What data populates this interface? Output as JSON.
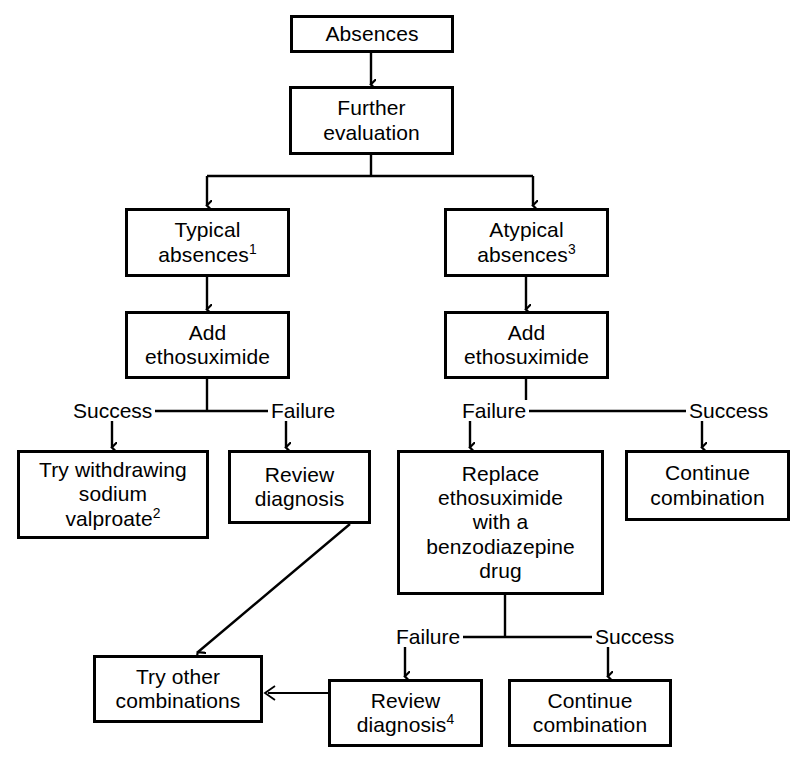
{
  "diagram": {
    "type": "flowchart",
    "colors": {
      "line": "#000000",
      "box_fill": "#ffffff",
      "text": "#000000",
      "background": "#ffffff"
    },
    "nodes": [
      {
        "id": "absences",
        "label": "Absences",
        "sup": ""
      },
      {
        "id": "further-evaluation",
        "line1": "Further",
        "line2": "evaluation"
      },
      {
        "id": "typical-absences",
        "line1": "Typical",
        "line2": "absences",
        "sup": "1"
      },
      {
        "id": "atypical-absences",
        "line1": "Atypical",
        "line2": "absences",
        "sup": "3"
      },
      {
        "id": "add-ethosuximide-left",
        "line1": "Add",
        "line2": "ethosuximide"
      },
      {
        "id": "add-ethosuximide-right",
        "line1": "Add",
        "line2": "ethosuximide"
      },
      {
        "id": "try-withdrawing-sodium-valproate",
        "line1": "Try withdrawing",
        "line2": "sodium",
        "line3": "valproate",
        "sup": "2"
      },
      {
        "id": "review-diagnosis-left",
        "line1": "Review",
        "line2": "diagnosis"
      },
      {
        "id": "replace-ethosuximide",
        "line1": "Replace",
        "line2": "ethosuximide",
        "line3": "with a",
        "line4": "benzodiazepine",
        "line5": "drug"
      },
      {
        "id": "continue-combination-right",
        "line1": "Continue",
        "line2": "combination"
      },
      {
        "id": "try-other-combinations",
        "line1": "Try other",
        "line2": "combinations"
      },
      {
        "id": "review-diagnosis-bottom",
        "line1": "Review",
        "line2": "diagnosis",
        "sup": "4"
      },
      {
        "id": "continue-combination-bottom",
        "line1": "Continue",
        "line2": "combination"
      }
    ],
    "edge_labels": {
      "left_success": "Success",
      "left_failure": "Failure",
      "right_failure": "Failure",
      "right_success": "Success",
      "bottom_failure": "Failure",
      "bottom_success": "Success"
    },
    "footnote_markers": [
      "1",
      "2",
      "3",
      "4"
    ]
  }
}
